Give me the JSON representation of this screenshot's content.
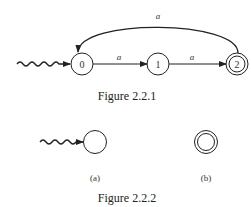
{
  "figure1": {
    "caption": "Figure 2.2.1",
    "states": [
      {
        "id": "0",
        "label": "0",
        "initial": true,
        "accepting": false
      },
      {
        "id": "1",
        "label": "1",
        "initial": false,
        "accepting": false
      },
      {
        "id": "2",
        "label": "2",
        "initial": false,
        "accepting": true
      }
    ],
    "transitions": [
      {
        "from": "0",
        "to": "1",
        "label": "a"
      },
      {
        "from": "1",
        "to": "2",
        "label": "a"
      },
      {
        "from": "2",
        "to": "0",
        "label": "a"
      }
    ]
  },
  "figure2": {
    "caption": "Figure 2.2.2",
    "parts": [
      {
        "label": "(a)",
        "description": "initial state"
      },
      {
        "label": "(b)",
        "description": "accepting state"
      }
    ]
  }
}
